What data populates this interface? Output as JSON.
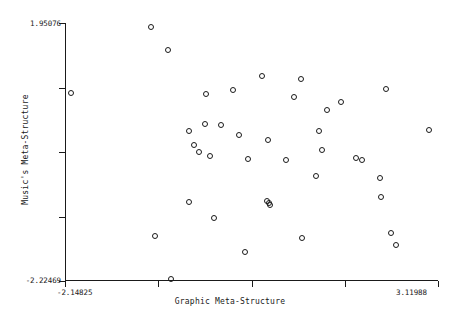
{
  "chart_data": {
    "type": "scatter",
    "title": "",
    "xlabel": "Graphic Meta-Structure",
    "ylabel": "Music's Meta-Structure",
    "xlim": [
      -2.14825,
      3.11988
    ],
    "ylim": [
      -2.22469,
      1.95076
    ],
    "grid": false,
    "legend": null,
    "xtick_labels": [
      "-2.14825",
      "3.11988"
    ],
    "ytick_labels": [
      "1.95076",
      "-2.22469"
    ],
    "n_ticks_x": 5,
    "n_ticks_y": 5,
    "marker_style": "open-circle",
    "marker_color": "#1a1a1a",
    "points": [
      {
        "x": -0.93,
        "y": 1.89
      },
      {
        "x": -0.7,
        "y": 1.52
      },
      {
        "x": -2.07,
        "y": 0.82
      },
      {
        "x": -0.15,
        "y": 0.8
      },
      {
        "x": 0.23,
        "y": 0.86
      },
      {
        "x": 0.64,
        "y": 1.1
      },
      {
        "x": 1.18,
        "y": 1.05
      },
      {
        "x": 1.55,
        "y": 0.55
      },
      {
        "x": 1.75,
        "y": 0.68
      },
      {
        "x": 2.38,
        "y": 0.88
      },
      {
        "x": 1.08,
        "y": 0.76
      },
      {
        "x": 1.44,
        "y": 0.2
      },
      {
        "x": 1.48,
        "y": -0.1
      },
      {
        "x": 0.72,
        "y": 0.05
      },
      {
        "x": 0.31,
        "y": 0.14
      },
      {
        "x": 0.05,
        "y": 0.3
      },
      {
        "x": -0.17,
        "y": 0.32
      },
      {
        "x": -0.4,
        "y": 0.2
      },
      {
        "x": -0.32,
        "y": -0.02
      },
      {
        "x": -0.25,
        "y": -0.13
      },
      {
        "x": -0.1,
        "y": -0.2
      },
      {
        "x": 0.44,
        "y": -0.25
      },
      {
        "x": 0.97,
        "y": -0.26
      },
      {
        "x": 1.96,
        "y": -0.24
      },
      {
        "x": 2.04,
        "y": -0.26
      },
      {
        "x": 2.99,
        "y": 0.22
      },
      {
        "x": 2.3,
        "y": -0.55
      },
      {
        "x": 2.32,
        "y": -0.86
      },
      {
        "x": 1.4,
        "y": -0.52
      },
      {
        "x": 0.7,
        "y": -0.93
      },
      {
        "x": -0.4,
        "y": -0.95
      },
      {
        "x": 0.74,
        "y": -0.96
      },
      {
        "x": 0.75,
        "y": -1.0
      },
      {
        "x": -0.88,
        "y": -1.5
      },
      {
        "x": 0.4,
        "y": -1.76
      },
      {
        "x": 1.2,
        "y": -1.53
      },
      {
        "x": 2.45,
        "y": -1.45
      },
      {
        "x": 2.52,
        "y": -1.65
      },
      {
        "x": -0.65,
        "y": -2.2
      },
      {
        "x": -0.05,
        "y": -1.2
      }
    ]
  }
}
